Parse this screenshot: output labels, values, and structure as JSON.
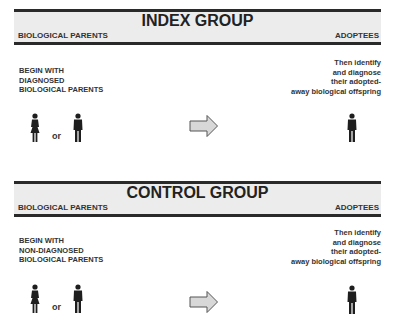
{
  "groups": [
    {
      "title": "INDEX GROUP",
      "left_label": "BIOLOGICAL PARENTS",
      "right_label": "ADOPTEES",
      "left_text": [
        "BEGIN WITH",
        "DIAGNOSED",
        "BIOLOGICAL PARENTS"
      ],
      "right_text": [
        "Then identify",
        "and diagnose",
        "their adopted-",
        "away biological offspring"
      ],
      "or_label": "or"
    },
    {
      "title": "CONTROL GROUP",
      "left_label": "BIOLOGICAL PARENTS",
      "right_label": "ADOPTEES",
      "left_text": [
        "BEGIN WITH",
        "NON-DIAGNOSED",
        "BIOLOGICAL PARENTS"
      ],
      "right_text": [
        "Then identify",
        "and diagnose",
        "their adopted-",
        "away biological offspring"
      ],
      "or_label": "or"
    }
  ],
  "icons": {
    "female": "female-figure-icon",
    "male": "male-figure-icon",
    "arrow": "right-arrow-icon"
  },
  "colors": {
    "band_fill": "#ececec",
    "band_rule": "#2a2a2a",
    "figure": "#1e1e1e",
    "arrow_fill": "#d8d8d8",
    "arrow_stroke": "#555555"
  }
}
